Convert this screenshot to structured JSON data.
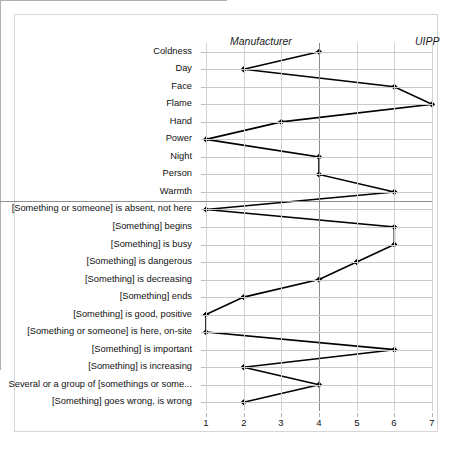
{
  "header": {
    "left_label": "Manufacturer",
    "right_label": "UIPP"
  },
  "chart_data": {
    "type": "line",
    "orientation": "horizontal",
    "title": "",
    "xlabel": "",
    "ylabel": "",
    "xlim": [
      1,
      7
    ],
    "xticks": [
      1,
      2,
      3,
      4,
      5,
      6,
      7
    ],
    "xtick_labels": [
      "1",
      "2",
      "3",
      "4",
      "5",
      "6",
      "7"
    ],
    "grid": true,
    "legend": null,
    "reference_line_x": 4,
    "separator_after_category": "Warmth",
    "categories": [
      "Coldness",
      "Day",
      "Face",
      "Flame",
      "Hand",
      "Power",
      "Night",
      "Person",
      "Warmth",
      "[Something or someone] is absent, not here",
      "[Something] begins",
      "[Something] is busy",
      "[Something] is dangerous",
      "[Something] is decreasing",
      "[Something] ends",
      "[Something] is good, positive",
      "[Something or someone] is here, on-site",
      "[Something] is important",
      "[Something] is increasing",
      "Several or a group of [somethings or some...",
      "[Something] goes wrong, is wrong"
    ],
    "values": [
      4,
      2,
      6,
      7,
      3,
      1,
      4,
      4,
      6,
      1,
      6,
      6,
      5,
      4,
      2,
      1,
      1,
      6,
      2,
      4,
      2
    ],
    "series": [
      {
        "name": "",
        "values": [
          4,
          2,
          6,
          7,
          3,
          1,
          4,
          4,
          6,
          1,
          6,
          6,
          5,
          4,
          2,
          1,
          1,
          6,
          2,
          4,
          2
        ]
      }
    ],
    "marker": "diamond",
    "line_color": "#000000",
    "marker_color": "#000000"
  }
}
